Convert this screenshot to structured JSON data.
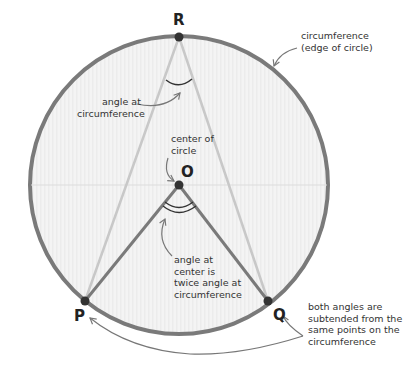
{
  "diagram": {
    "colors": {
      "circle_edge": "#7a7a7a",
      "circle_fill": "#f3f3f3",
      "chord_dark": "#7a7a7a",
      "chord_light": "#c8c8c8",
      "point": "#333333",
      "text": "#333333",
      "arrow": "#777777"
    },
    "points": {
      "R": "R",
      "O": "O",
      "P": "P",
      "Q": "Q"
    },
    "labels": {
      "circumference_line1": "circumference",
      "circumference_line2": "(edge of circle)",
      "angle_circ_line1": "angle at",
      "angle_circ_line2": "circumference",
      "center_line1": "center of",
      "center_line2": "circle",
      "angle_center_line1": "angle at",
      "angle_center_line2": "center is",
      "angle_center_line3": "twice angle at",
      "angle_center_line4": "circumference",
      "subtended_line1": "both angles are",
      "subtended_line2": "subtended from the",
      "subtended_line3": "same points on the",
      "subtended_line4": "circumference"
    }
  }
}
